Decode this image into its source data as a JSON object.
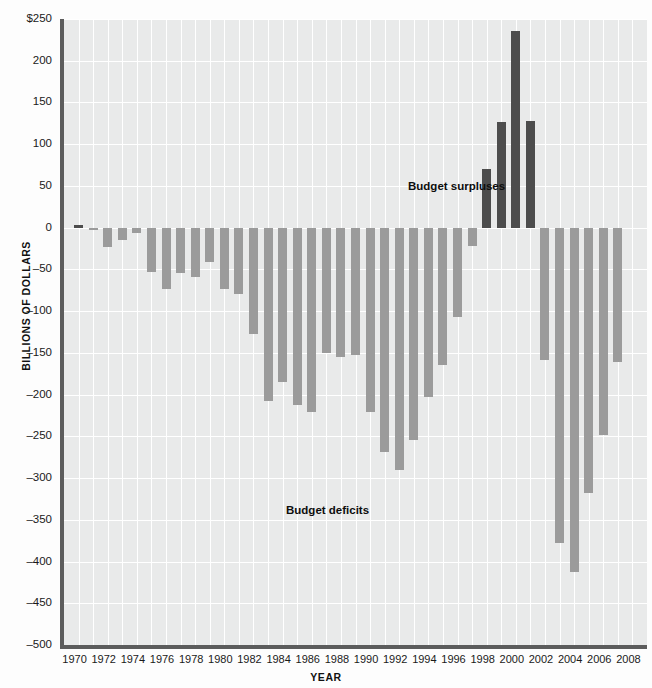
{
  "chart_data": {
    "type": "bar",
    "title": "",
    "xlabel": "YEAR",
    "ylabel": "BILLIONS OF DOLLARS",
    "ylim": [
      -500,
      250
    ],
    "ytick_values": [
      250,
      200,
      150,
      100,
      50,
      0,
      -50,
      -100,
      -150,
      -200,
      -250,
      -300,
      -350,
      -400,
      -450,
      -500
    ],
    "ytick_labels": [
      "$250",
      "200",
      "150",
      "100",
      "50",
      "0",
      "–50",
      "–100",
      "–150",
      "–200",
      "–250",
      "–300",
      "–350",
      "–400",
      "–450",
      "–500"
    ],
    "xlim": [
      1969,
      2009
    ],
    "xtick_labels": [
      "1970",
      "1972",
      "1974",
      "1976",
      "1978",
      "1980",
      "1982",
      "1984",
      "1986",
      "1988",
      "1990",
      "1992",
      "1994",
      "1996",
      "1998",
      "2000",
      "2002",
      "2004",
      "2006",
      "2008"
    ],
    "grid": true,
    "legend": "none",
    "categories": [
      1970,
      1971,
      1972,
      1973,
      1974,
      1975,
      1976,
      1977,
      1978,
      1979,
      1980,
      1981,
      1982,
      1983,
      1984,
      1985,
      1986,
      1987,
      1988,
      1989,
      1990,
      1991,
      1992,
      1993,
      1994,
      1995,
      1996,
      1997,
      1998,
      1999,
      2000,
      2001,
      2002,
      2003,
      2004,
      2005,
      2006,
      2007,
      2008
    ],
    "values": [
      3,
      -3,
      -23,
      -15,
      -6,
      -53,
      -74,
      -54,
      -59,
      -41,
      -74,
      -79,
      -128,
      -208,
      -185,
      -212,
      -221,
      -150,
      -155,
      -153,
      -221,
      -269,
      -290,
      -255,
      -203,
      -164,
      -107,
      -22,
      70,
      126,
      236,
      128,
      -158,
      -378,
      -413,
      -318,
      -248,
      -161,
      0
    ],
    "series": [
      {
        "name": "Budget deficits",
        "color": "#9b9b9b",
        "description": "Years with a federal budget deficit (negative values)"
      },
      {
        "name": "Budget surpluses",
        "color": "#4d4d4d",
        "description": "Years with a federal budget surplus (positive values), 1998–2001"
      }
    ],
    "annotations": [
      {
        "text": "Budget surpluses",
        "x": 1994,
        "y": 108
      },
      {
        "text": "Budget deficits",
        "x": 1983,
        "y": -308
      }
    ]
  },
  "axes": {
    "y_title": "BILLIONS OF DOLLARS",
    "x_title": "YEAR"
  },
  "annotations": {
    "surpluses": "Budget surpluses",
    "deficits": "Budget deficits"
  },
  "colors": {
    "deficit_bar": "#9b9b9b",
    "surplus_bar": "#4d4d4d",
    "plot_background": "#e9eaea",
    "gridline": "#ffffff",
    "axis_line": "#5c5c5c"
  }
}
